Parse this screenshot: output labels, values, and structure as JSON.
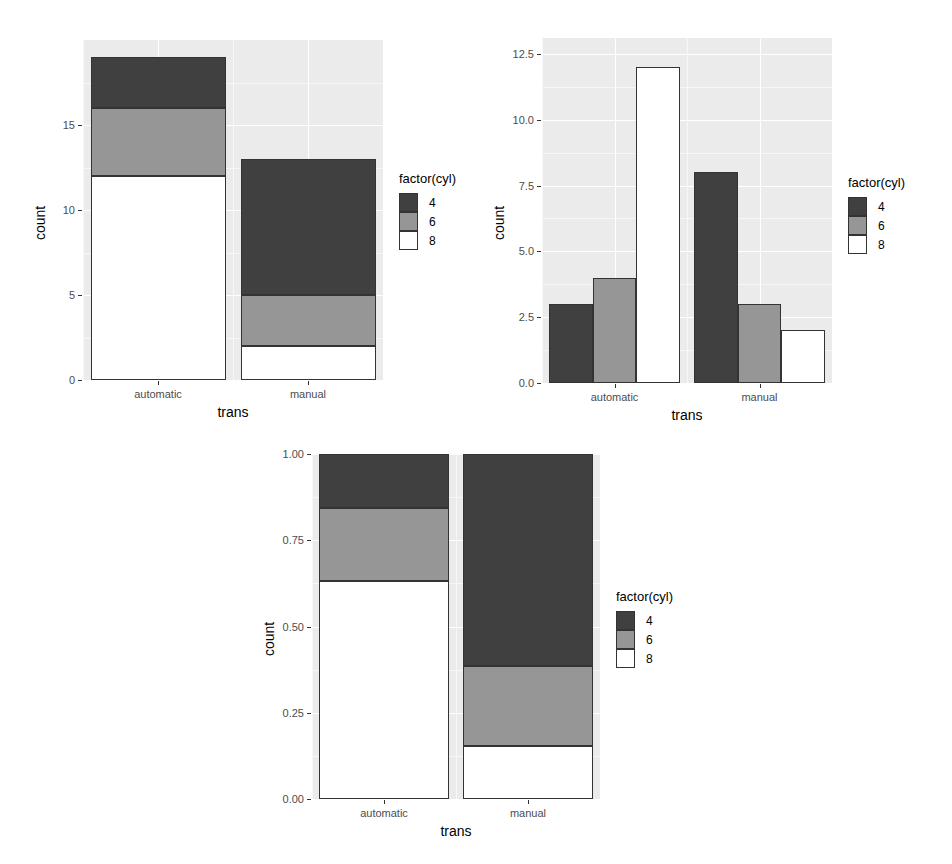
{
  "page": {
    "width": 952,
    "height": 864,
    "background": "#ffffff"
  },
  "palette": {
    "panel_background": "#ebebeb",
    "grid_major": "#ffffff",
    "grid_minor": "#f7f7f7",
    "bar_outline": "#333333",
    "cyl_4": "#404040",
    "cyl_6": "#969696",
    "cyl_8": "#ffffff",
    "axis_text": "#4d4d4d",
    "axis_title": "#000000"
  },
  "legend_shared": {
    "title": "factor(cyl)",
    "keys": [
      {
        "label": "4",
        "color": "#404040"
      },
      {
        "label": "6",
        "color": "#969696"
      },
      {
        "label": "8",
        "color": "#ffffff"
      }
    ]
  },
  "chart_data": [
    {
      "id": "stacked",
      "type": "bar",
      "stacking": "stack",
      "title": "",
      "xlabel": "trans",
      "ylabel": "count",
      "categories": [
        "automatic",
        "manual"
      ],
      "ytick_labels": [
        "0",
        "5",
        "10",
        "15"
      ],
      "yticks": [
        0,
        5,
        10,
        15
      ],
      "ylim": [
        0,
        20
      ],
      "grid": true,
      "legend_position": "right",
      "series": [
        {
          "name": "4",
          "color": "#404040",
          "values": [
            3,
            8
          ]
        },
        {
          "name": "6",
          "color": "#969696",
          "values": [
            4,
            3
          ]
        },
        {
          "name": "8",
          "color": "#ffffff",
          "values": [
            12,
            2
          ]
        }
      ],
      "totals": [
        19,
        13
      ],
      "segment_bounds": {
        "automatic": [
          {
            "cyl": "8",
            "from": 0,
            "to": 12
          },
          {
            "cyl": "6",
            "from": 12,
            "to": 16
          },
          {
            "cyl": "4",
            "from": 16,
            "to": 19
          }
        ],
        "manual": [
          {
            "cyl": "8",
            "from": 0,
            "to": 2
          },
          {
            "cyl": "6",
            "from": 2,
            "to": 5
          },
          {
            "cyl": "4",
            "from": 5,
            "to": 13
          }
        ]
      }
    },
    {
      "id": "dodged",
      "type": "bar",
      "stacking": "dodge",
      "title": "",
      "xlabel": "trans",
      "ylabel": "count",
      "categories": [
        "automatic",
        "manual"
      ],
      "ytick_labels": [
        "0.0",
        "2.5",
        "5.0",
        "7.5",
        "10.0",
        "12.5"
      ],
      "yticks": [
        0,
        2.5,
        5,
        7.5,
        10,
        12.5
      ],
      "ylim": [
        0,
        13.1
      ],
      "grid": true,
      "legend_position": "right",
      "series": [
        {
          "name": "4",
          "color": "#404040",
          "values": [
            3,
            8
          ]
        },
        {
          "name": "6",
          "color": "#969696",
          "values": [
            4,
            3
          ]
        },
        {
          "name": "8",
          "color": "#ffffff",
          "values": [
            12,
            2
          ]
        }
      ]
    },
    {
      "id": "filled",
      "type": "bar",
      "stacking": "fill",
      "title": "",
      "xlabel": "trans",
      "ylabel": "count",
      "categories": [
        "automatic",
        "manual"
      ],
      "ytick_labels": [
        "0.00",
        "0.25",
        "0.50",
        "0.75",
        "1.00"
      ],
      "yticks": [
        0,
        0.25,
        0.5,
        0.75,
        1
      ],
      "ylim": [
        0,
        1
      ],
      "grid": true,
      "legend_position": "right",
      "series": [
        {
          "name": "4",
          "color": "#404040",
          "values": [
            0.158,
            0.615
          ]
        },
        {
          "name": "6",
          "color": "#969696",
          "values": [
            0.211,
            0.231
          ]
        },
        {
          "name": "8",
          "color": "#ffffff",
          "values": [
            0.632,
            0.154
          ]
        }
      ],
      "segment_bounds": {
        "automatic": [
          {
            "cyl": "8",
            "from": 0,
            "to": 0.632
          },
          {
            "cyl": "6",
            "from": 0.632,
            "to": 0.842
          },
          {
            "cyl": "4",
            "from": 0.842,
            "to": 1.0
          }
        ],
        "manual": [
          {
            "cyl": "8",
            "from": 0,
            "to": 0.154
          },
          {
            "cyl": "6",
            "from": 0.154,
            "to": 0.385
          },
          {
            "cyl": "4",
            "from": 0.385,
            "to": 1.0
          }
        ]
      }
    }
  ]
}
